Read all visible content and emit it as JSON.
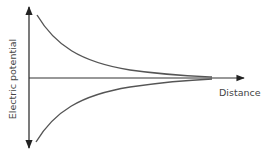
{
  "diagram": {
    "type": "graph-sketch",
    "x_axis_label": "Distance",
    "y_axis_label": "Electric potential",
    "curves": [
      {
        "name": "positive-potential-curve",
        "description": "Decays from high positive value toward zero with increasing distance"
      },
      {
        "name": "negative-potential-curve",
        "description": "Rises from large negative value toward zero with increasing distance"
      }
    ],
    "colors": {
      "axis": "#222222",
      "curve": "#555555",
      "label": "#444444"
    }
  }
}
